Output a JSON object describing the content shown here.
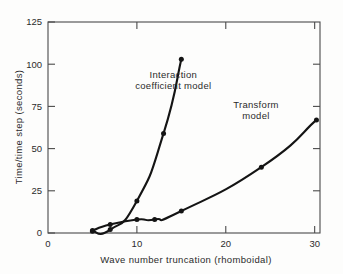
{
  "chart_data": {
    "type": "line",
    "title": "",
    "xlabel": "Wave number truncation (rhomboidal)",
    "ylabel": "Time/time step (seconds)",
    "xlim": [
      0,
      30.6
    ],
    "ylim": [
      0,
      125
    ],
    "xticks": [
      0,
      10,
      20,
      30
    ],
    "xtick_labels": [
      "0",
      "10",
      "20",
      "30"
    ],
    "yticks": [
      0,
      25,
      50,
      75,
      100,
      125
    ],
    "ytick_labels": [
      "0",
      "25",
      "50",
      "75",
      "100",
      "125"
    ],
    "grid": false,
    "legend_position": "inline-annotations",
    "frame": "box",
    "tick_direction": "in",
    "markers": "filled-circle",
    "line_color": "#141414",
    "axis_color": "#4a4a4a",
    "series": [
      {
        "name": "Interaction coefficient model",
        "label_line_1": "Interaction",
        "label_line_2": "coefficient model",
        "x": [
          5,
          7,
          10,
          13,
          15
        ],
        "values": [
          1,
          2,
          19,
          59,
          103
        ]
      },
      {
        "name": "Transform model",
        "label_line_1": "Transform",
        "label_line_2": "model",
        "x": [
          5,
          7,
          10,
          12,
          15,
          24,
          30.2
        ],
        "values": [
          1.5,
          5,
          8,
          8,
          13,
          39,
          67
        ]
      }
    ]
  },
  "annotations": {
    "interaction_label_x": 14.1,
    "interaction_label_y": 92,
    "transform_label_x": 23.4,
    "transform_label_y": 74
  }
}
